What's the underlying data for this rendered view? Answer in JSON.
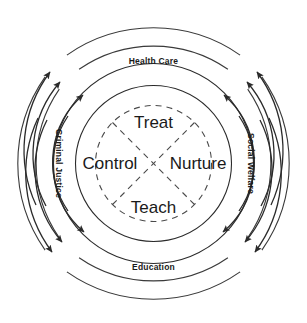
{
  "diagram": {
    "colors": {
      "background": "#ffffff",
      "stroke": "#2b2b2b",
      "dashed_stroke": "#4a4a4a",
      "text": "#1a1a1a"
    },
    "core": {
      "shape": "dashed-circle-with-x",
      "quadrants": [
        {
          "id": "top",
          "label": "Treat"
        },
        {
          "id": "left",
          "label": "Control"
        },
        {
          "id": "right",
          "label": "Nurture"
        },
        {
          "id": "bottom",
          "label": "Teach"
        }
      ]
    },
    "domains": [
      {
        "id": "top",
        "label": "Health Care",
        "position": "top",
        "rotation": 0
      },
      {
        "id": "left",
        "label": "Criminal Justice",
        "position": "left",
        "rotation": 90
      },
      {
        "id": "right",
        "label": "Social Welfare",
        "position": "right",
        "rotation": 90
      },
      {
        "id": "bottom",
        "label": "Education",
        "position": "bottom",
        "rotation": 0
      }
    ],
    "rings": [
      {
        "id": "core-dashed",
        "style": "dashed",
        "radius": 58
      },
      {
        "id": "inner-solid",
        "style": "solid",
        "radius": 78
      },
      {
        "id": "label-solid",
        "style": "solid",
        "radius": 100
      }
    ],
    "arrow_bands": [
      {
        "id": "inner-arrow-band",
        "radius": 88,
        "direction": "converging-to-top-and-bottom"
      },
      {
        "id": "outer-arrow-band",
        "radius": 110,
        "direction": "converging-to-top-and-bottom"
      },
      {
        "id": "outermost-arrow-band",
        "radius": 131,
        "direction": "converging-to-top-and-bottom"
      }
    ],
    "outer_arcs": [
      {
        "id": "outer-arc-ring",
        "radius": 131,
        "style": "broken"
      },
      {
        "id": "outermost-arc-ring",
        "radius": 151,
        "style": "broken"
      }
    ]
  }
}
